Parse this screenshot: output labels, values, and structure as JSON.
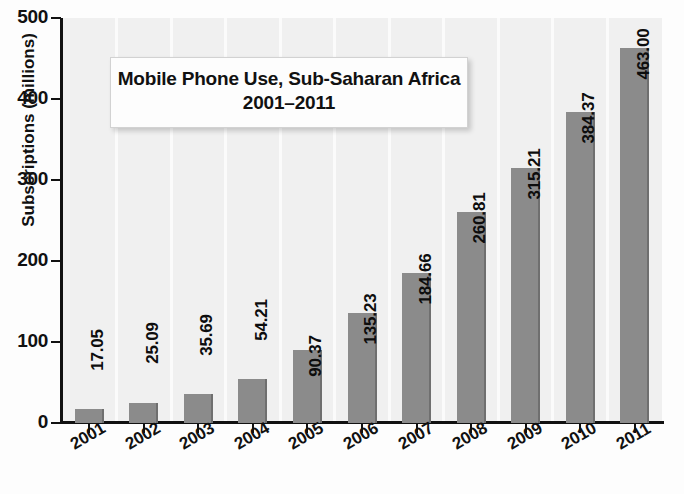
{
  "chart_data": {
    "type": "bar",
    "title": "Mobile Phone Use, Sub-Saharan Africa",
    "subtitle": "2001–2011",
    "xlabel": "",
    "ylabel": "Subscriptions (millions)",
    "ylim": [
      0,
      500
    ],
    "yticks": [
      "0",
      "100",
      "200",
      "300",
      "400",
      "500"
    ],
    "grid": "vertical-faint",
    "legend": "none",
    "bar_color": "#8b8b8b",
    "panel_color": "#f0f0f0",
    "axis_color": "#111111",
    "categories": [
      "2001",
      "2002",
      "2003",
      "2004",
      "2005",
      "2006",
      "2007",
      "2008",
      "2009",
      "2010",
      "2011"
    ],
    "values": [
      17.05,
      25.09,
      35.69,
      54.21,
      90.37,
      135.23,
      184.66,
      260.81,
      315.21,
      384.37,
      463.0
    ],
    "value_labels": [
      "17.05",
      "25.09",
      "35.69",
      "54.21",
      "90.37",
      "135.23",
      "184.66",
      "260.81",
      "315.21",
      "384.37",
      "463.00"
    ]
  }
}
